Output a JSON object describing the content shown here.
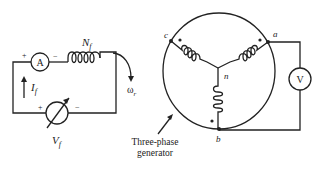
{
  "diagram": {
    "field_circuit": {
      "ammeter_label": "A",
      "ammeter_plus": "+",
      "ammeter_minus": "−",
      "field_winding_label": "N",
      "field_winding_sub": "f",
      "current_label": "I",
      "current_sub": "f",
      "source_plus": "+",
      "source_minus": "−",
      "source_label": "V",
      "source_sub": "f",
      "speed_label": "ω",
      "speed_sub": "r"
    },
    "generator": {
      "caption_line1": "Three-phase",
      "caption_line2": "generator",
      "terminal_a": "a",
      "terminal_b": "b",
      "terminal_c": "c",
      "neutral": "n",
      "voltmeter_label": "V"
    }
  }
}
